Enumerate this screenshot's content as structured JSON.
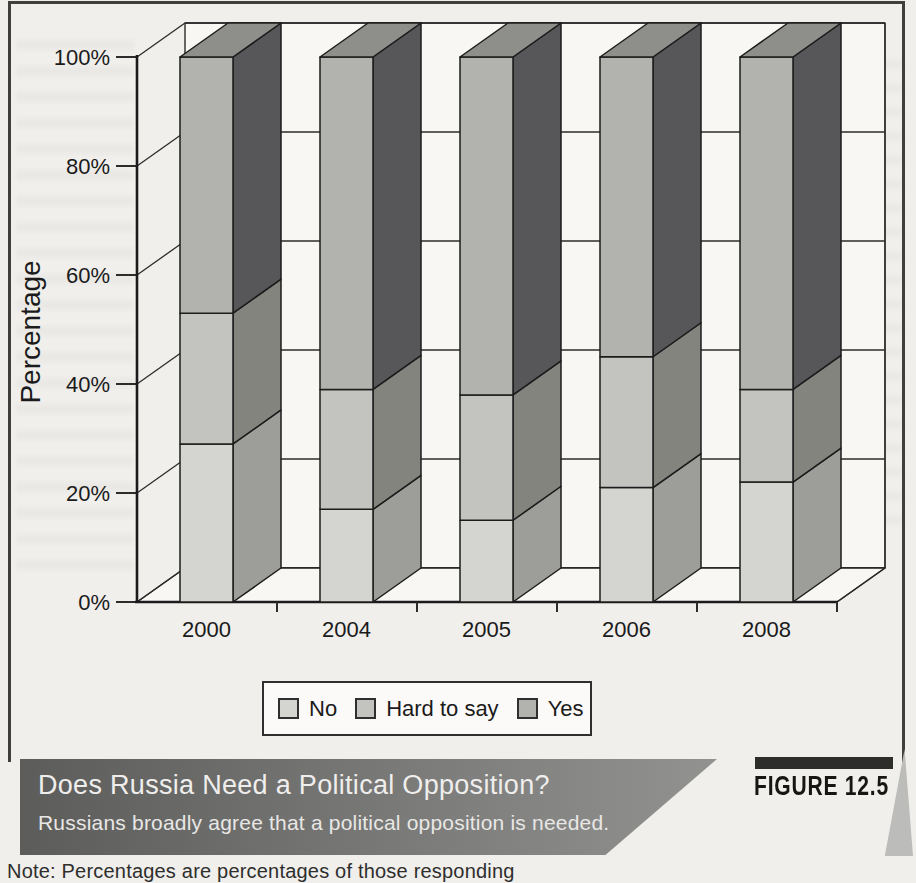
{
  "figure": {
    "label": "FIGURE 12.5",
    "title": "Does Russia Need a Political Opposition?",
    "subtitle": "Russians broadly agree that a political opposition is needed.",
    "note": "Note: Percentages are percentages of those responding"
  },
  "chart_data": {
    "type": "bar",
    "stacked": true,
    "projection": "3d",
    "title": "",
    "xlabel": "",
    "ylabel": "Percentage",
    "categories": [
      "2000",
      "2004",
      "2005",
      "2006",
      "2008"
    ],
    "series": [
      {
        "name": "No",
        "values": [
          29,
          17,
          15,
          21,
          22
        ],
        "front_color": "#d4d4d1",
        "side_color": "#9d9d9a"
      },
      {
        "name": "Hard to say",
        "values": [
          24,
          22,
          23,
          24,
          17
        ],
        "front_color": "#c3c3c0",
        "side_color": "#84847f"
      },
      {
        "name": "Yes",
        "values": [
          47,
          61,
          62,
          55,
          61
        ],
        "front_color": "#b2b2af",
        "side_color": "#57575A"
      }
    ],
    "top_face_color": "#8e8e8b",
    "y_ticks": [
      "0%",
      "20%",
      "40%",
      "60%",
      "80%",
      "100%"
    ],
    "ylim": [
      0,
      100
    ],
    "grid": true,
    "legend_position": "bottom"
  },
  "colors": {
    "paper": "#f0efec",
    "wall": "#f8f7f4",
    "outline": "#1c1c1c",
    "band_dark": "#5c5c5a",
    "band_light": "#929290",
    "figure_tab": "#2d2d2b"
  }
}
